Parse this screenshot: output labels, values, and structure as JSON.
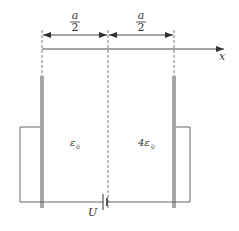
{
  "diagram": {
    "type": "capacitor-circuit",
    "dimensions": [
      {
        "label_num": "a",
        "label_den": "2",
        "from": "left-plate",
        "to": "midplane"
      },
      {
        "label_num": "a",
        "label_den": "2",
        "from": "midplane",
        "to": "right-plate"
      }
    ],
    "axis": {
      "label": "x"
    },
    "regions": [
      {
        "label": "ε",
        "subscript": "0"
      },
      {
        "label": "4ε",
        "subscript": "0"
      }
    ],
    "source": {
      "label": "U"
    },
    "colors": {
      "plate": "#a8a8a8",
      "line": "#444444",
      "dash": "#555555"
    }
  }
}
